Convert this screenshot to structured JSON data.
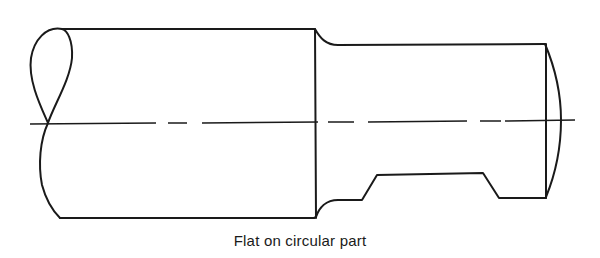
{
  "figure": {
    "caption": "Flat on circular part",
    "line_color": "#1a1a1a",
    "background": "#ffffff"
  }
}
